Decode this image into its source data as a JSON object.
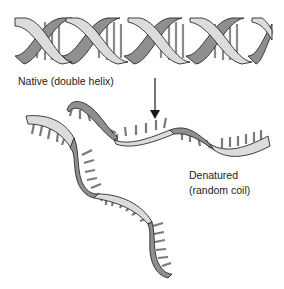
{
  "diagram": {
    "labels": {
      "native": "Native (double helix)",
      "denatured_line1": "Denatured",
      "denatured_line2": "(random coil)"
    },
    "colors": {
      "light_strand": "#d6d6d6",
      "dark_strand": "#8a8a8a",
      "outline": "#2a2a2a",
      "base_pairs": "#7a7a7a",
      "arrow": "#1a1a1a",
      "text": "#222222"
    },
    "elements": [
      {
        "id": "double-helix",
        "description": "Native double-stranded DNA helix with base-pair rungs"
      },
      {
        "id": "arrow",
        "description": "Downward arrow indicating denaturation"
      },
      {
        "id": "strand-a",
        "description": "Separated single strand, horizontal wavy ribbon with bases"
      },
      {
        "id": "strand-b",
        "description": "Separated single strand, descending S-shaped ribbon with bases"
      }
    ]
  }
}
